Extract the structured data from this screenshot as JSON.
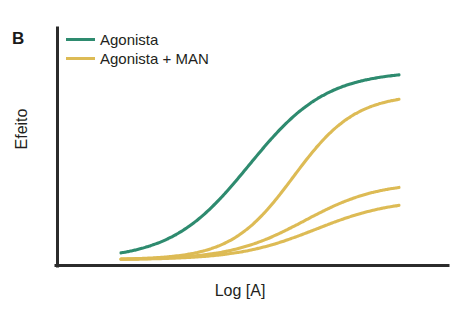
{
  "figure": {
    "panel_label": "B",
    "background_color": "#ffffff"
  },
  "legend": {
    "position": "top-left-inside",
    "entries": [
      {
        "label": "Agonista",
        "color": "#2E8B6F",
        "swatch_name": "legend-swatch-agonista"
      },
      {
        "label": "Agonista + MAN",
        "color": "#DDBB55",
        "swatch_name": "legend-swatch-agonista-man"
      }
    ]
  },
  "axes": {
    "x_label": "Log [A]",
    "y_label": "Efeito",
    "axis_color": "#2b2b2b",
    "x_ticks": [],
    "y_ticks": [],
    "grid": false
  },
  "chart_data": {
    "type": "line",
    "title": "",
    "subtitle": "",
    "xlabel": "Log [A]",
    "ylabel": "Efeito",
    "xlim": [
      0,
      100
    ],
    "ylim": [
      0,
      100
    ],
    "grid": false,
    "legend_position": "top-left",
    "axis_ticks_shown": false,
    "x": [
      0,
      8,
      16,
      24,
      32,
      40,
      48,
      56,
      64,
      72,
      80,
      88,
      96,
      100
    ],
    "series": [
      {
        "name": "Agonista",
        "color": "#2E8B6F",
        "emax": 100,
        "ec50_x": 46,
        "hill": 1.0,
        "values": [
          1,
          2,
          4,
          8,
          17,
          33,
          55,
          75,
          88,
          95,
          98,
          99,
          100,
          100
        ]
      },
      {
        "name": "Agonista + MAN (concentracao 1)",
        "color": "#DDBB55",
        "emax": 88,
        "ec50_x": 62,
        "hill": 1.25,
        "values": [
          0,
          1,
          2,
          3,
          6,
          11,
          21,
          37,
          56,
          72,
          82,
          86,
          88,
          88
        ]
      },
      {
        "name": "Agonista + MAN (concentracao 2)",
        "color": "#DDBB55",
        "emax": 42,
        "ec50_x": 66,
        "hill": 1.05,
        "values": [
          0,
          0,
          1,
          2,
          3,
          6,
          10,
          17,
          26,
          34,
          39,
          41,
          42,
          42
        ]
      },
      {
        "name": "Agonista + MAN (concentracao 3)",
        "color": "#DDBB55",
        "emax": 33,
        "ec50_x": 70,
        "hill": 1.0,
        "values": [
          0,
          0,
          1,
          1,
          2,
          4,
          7,
          12,
          19,
          26,
          30,
          32,
          33,
          33
        ]
      }
    ]
  }
}
